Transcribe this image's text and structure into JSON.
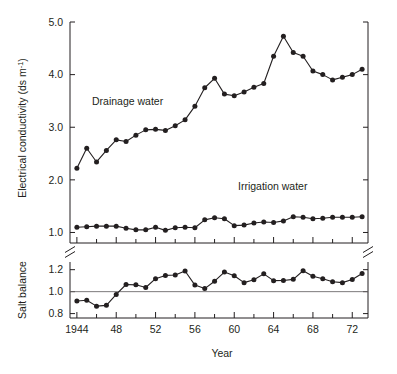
{
  "figure": {
    "xlabel": "Year",
    "panels": {
      "top": {
        "ylabel": "Electrical conductivity (ds m",
        "ylabel_exponent": "-1",
        "ylabel_close": ")",
        "ytick_labels": [
          "1.0",
          "2.0",
          "3.0",
          "4.0",
          "5.0"
        ],
        "series_labels": {
          "drainage": "Drainage water",
          "irrigation": "Irrigation water"
        }
      },
      "bottom": {
        "ylabel": "Salt balance",
        "ytick_labels": [
          "0.8",
          "1.0",
          "1.2"
        ]
      }
    },
    "xtick_labels": [
      "1944",
      "48",
      "52",
      "56",
      "60",
      "64",
      "68",
      "72"
    ]
  },
  "chart_data": {
    "type": "line",
    "title": "",
    "xlabel": "Year",
    "panels": [
      {
        "name": "electrical-conductivity",
        "ylabel": "Electrical conductivity (ds m^-1)",
        "ylim": [
          0.8,
          5.0
        ],
        "yticks": [
          1.0,
          2.0,
          3.0,
          4.0,
          5.0
        ],
        "xlim": [
          1943.3,
          1973.6
        ],
        "xticks": [
          1944,
          1946,
          1948,
          1950,
          1952,
          1954,
          1956,
          1958,
          1960,
          1962,
          1964,
          1966,
          1968,
          1970,
          1972
        ],
        "xticklabels_major": [
          1944,
          1948,
          1952,
          1956,
          1960,
          1964,
          1968,
          1972
        ],
        "grid": false,
        "legend": "inline-annotations",
        "series": [
          {
            "name": "Drainage water",
            "x": [
              1944,
              1945,
              1946,
              1947,
              1948,
              1949,
              1950,
              1951,
              1952,
              1953,
              1954,
              1955,
              1956,
              1957,
              1958,
              1959,
              1960,
              1961,
              1962,
              1963,
              1964,
              1965,
              1966,
              1967,
              1968,
              1969,
              1970,
              1971,
              1972,
              1973
            ],
            "values": [
              2.22,
              2.6,
              2.34,
              2.56,
              2.76,
              2.73,
              2.85,
              2.95,
              2.96,
              2.94,
              3.03,
              3.14,
              3.4,
              3.75,
              3.93,
              3.63,
              3.6,
              3.67,
              3.76,
              3.83,
              4.35,
              4.73,
              4.42,
              4.35,
              4.07,
              4.0,
              3.9,
              3.95,
              4.0,
              4.1
            ]
          },
          {
            "name": "Irrigation water",
            "x": [
              1944,
              1945,
              1946,
              1947,
              1948,
              1949,
              1950,
              1951,
              1952,
              1953,
              1954,
              1955,
              1956,
              1957,
              1958,
              1959,
              1960,
              1961,
              1962,
              1963,
              1964,
              1965,
              1966,
              1967,
              1968,
              1969,
              1970,
              1971,
              1972,
              1973
            ],
            "values": [
              1.1,
              1.11,
              1.12,
              1.12,
              1.12,
              1.08,
              1.05,
              1.05,
              1.1,
              1.04,
              1.09,
              1.1,
              1.09,
              1.24,
              1.28,
              1.26,
              1.13,
              1.14,
              1.18,
              1.2,
              1.19,
              1.22,
              1.3,
              1.29,
              1.26,
              1.27,
              1.29,
              1.29,
              1.29,
              1.3
            ]
          }
        ]
      },
      {
        "name": "salt-balance",
        "ylabel": "Salt balance",
        "ylim": [
          0.76,
          1.27
        ],
        "yticks": [
          0.8,
          1.0,
          1.2
        ],
        "reference_line": 1.0,
        "grid": false,
        "series": [
          {
            "name": "Salt balance",
            "x": [
              1944,
              1945,
              1946,
              1947,
              1948,
              1949,
              1950,
              1951,
              1952,
              1953,
              1954,
              1955,
              1956,
              1957,
              1958,
              1959,
              1960,
              1961,
              1962,
              1963,
              1964,
              1965,
              1966,
              1967,
              1968,
              1969,
              1970,
              1971,
              1972,
              1973
            ],
            "values": [
              0.915,
              0.922,
              0.868,
              0.875,
              0.975,
              1.065,
              1.062,
              1.038,
              1.118,
              1.148,
              1.152,
              1.188,
              1.06,
              1.028,
              1.095,
              1.178,
              1.145,
              1.082,
              1.108,
              1.162,
              1.1,
              1.102,
              1.112,
              1.19,
              1.14,
              1.118,
              1.09,
              1.082,
              1.11,
              1.165
            ]
          }
        ]
      }
    ]
  }
}
